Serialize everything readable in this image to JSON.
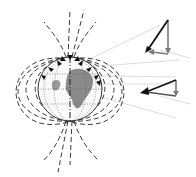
{
  "diagram": {
    "globe": {
      "cx": 70,
      "cy": 89,
      "r": 32,
      "land_color": "#8a8a8a",
      "outline_color": "#333333"
    },
    "field_lines_color": "#222222",
    "projection_lines_color": "#d8d8d8",
    "vectors": [
      {
        "label": "upper-vector",
        "total_color": "#111111",
        "component_color": "#7a7a7a"
      },
      {
        "label": "lower-vector",
        "total_color": "#111111",
        "component_color": "#7a7a7a"
      }
    ]
  }
}
